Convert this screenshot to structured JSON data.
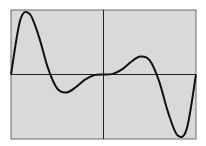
{
  "chart_data": {
    "type": "line",
    "title": "",
    "xlabel": "",
    "ylabel": "",
    "grid": false,
    "legend": null,
    "background": "#d9d9d9",
    "line_color": "#111111",
    "axis_color": "#222222",
    "frame_color": "#555555",
    "xlim": [
      -1,
      1
    ],
    "ylim": [
      -1,
      1
    ],
    "axes_through_origin": true,
    "series": [
      {
        "name": "f(x)",
        "x": [
          -1.0,
          -0.9,
          -0.8,
          -0.7,
          -0.6,
          -0.5,
          -0.4,
          -0.3,
          -0.2,
          -0.1,
          0.0,
          0.1,
          0.2,
          0.3,
          0.4,
          0.5,
          0.6,
          0.7,
          0.8,
          0.9,
          1.0
        ],
        "y": [
          0.0,
          0.85,
          0.95,
          0.6,
          0.1,
          -0.22,
          -0.28,
          -0.2,
          -0.08,
          -0.01,
          0.0,
          0.01,
          0.08,
          0.2,
          0.28,
          0.22,
          -0.1,
          -0.6,
          -0.95,
          -0.85,
          0.0
        ]
      }
    ]
  }
}
